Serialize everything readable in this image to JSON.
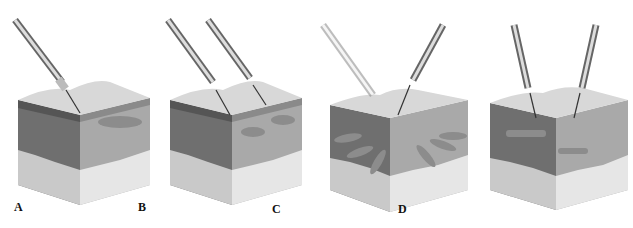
{
  "figure": {
    "panels": [
      {
        "id": "A",
        "label": "A",
        "left": 0,
        "label_x": 14,
        "label_y": 202,
        "needles": 1,
        "technique": "single-needle-bleb"
      },
      {
        "id": "B",
        "label": "B",
        "left": 158,
        "label_x": 138,
        "label_y": 202,
        "needles": 2,
        "technique": "two-needle-blebs"
      },
      {
        "id": "C",
        "label": "C",
        "left": 318,
        "label_x": 272,
        "label_y": 204,
        "needles": 2,
        "technique": "fanning"
      },
      {
        "id": "D",
        "label": "D",
        "left": 478,
        "label_x": 398,
        "label_y": 204,
        "needles": 2,
        "technique": "linear-threading"
      }
    ],
    "colors": {
      "background": "#ffffff",
      "surface_top": "#d8d8d8",
      "epidermis": "#8a8a8a",
      "dermis_left": "#6f6f6f",
      "dermis_right": "#a9a9a9",
      "fat_left": "#c9c9c9",
      "fat_right": "#e6e6e6",
      "needle": "#444444",
      "label": "#111111"
    }
  }
}
